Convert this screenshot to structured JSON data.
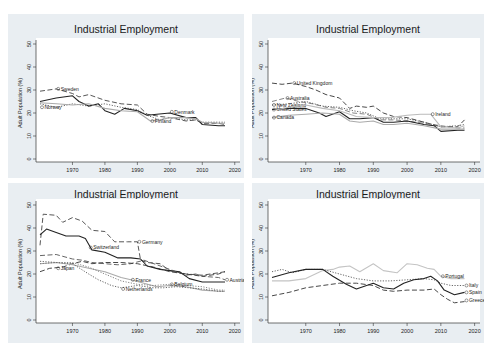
{
  "chart_data": [
    {
      "type": "line",
      "title": "Industrial Employment",
      "subtitle": "Nordic Countries",
      "xlabel": "",
      "ylabel": "Adult Population (%)",
      "xlim": [
        1960,
        2021
      ],
      "ylim": [
        0,
        50
      ],
      "xticks": [
        1970,
        1980,
        1990,
        2000,
        2010,
        2020
      ],
      "yticks": [
        0,
        10,
        20,
        30,
        40,
        50
      ],
      "series": [
        {
          "name": "Sweden",
          "style": "dash",
          "color": "#444444",
          "label_at": [
            1965,
            30.5
          ],
          "x": [
            1960,
            1965,
            1970,
            1972,
            1975,
            1980,
            1985,
            1990,
            1993,
            1997,
            2000,
            2005,
            2008,
            2010,
            2015,
            2017
          ],
          "y": [
            29.5,
            30.5,
            28.5,
            27,
            28,
            25.5,
            24,
            23.5,
            19.5,
            18.5,
            18,
            16.5,
            17,
            15.5,
            15.5,
            15
          ]
        },
        {
          "name": "Norway",
          "style": "dot",
          "color": "#555555",
          "label_at": [
            1960,
            22.5
          ],
          "x": [
            1960,
            1965,
            1970,
            1975,
            1980,
            1985,
            1990,
            1993,
            1997,
            2000,
            2005,
            2008,
            2010,
            2015,
            2017
          ],
          "y": [
            24,
            22.5,
            24,
            23,
            24,
            22.5,
            21.5,
            19,
            17,
            18,
            17,
            17,
            16,
            16,
            16
          ]
        },
        {
          "name": "Denmark",
          "style": "solid",
          "color": "#222222",
          "label_at": [
            2000,
            20.5
          ],
          "x": [
            1960,
            1965,
            1970,
            1972,
            1975,
            1978,
            1980,
            1983,
            1986,
            1990,
            1993,
            1996,
            2000,
            2005,
            2008,
            2010,
            2015,
            2017
          ],
          "y": [
            25,
            26.5,
            27.5,
            25,
            23,
            24,
            21,
            19.5,
            22,
            21,
            19,
            19.5,
            20,
            18,
            18,
            15,
            14.5,
            14.5
          ]
        },
        {
          "name": "Finland",
          "style": "solid",
          "color": "#aaaaaa",
          "label_at": [
            1994,
            16.5
          ],
          "x": [
            1960,
            1965,
            1970,
            1975,
            1980,
            1985,
            1990,
            1994,
            1997,
            2000,
            2005,
            2008,
            2010,
            2015,
            2017
          ],
          "y": [
            24.5,
            24,
            23.5,
            24,
            22,
            21,
            20.5,
            16.5,
            17,
            18,
            18,
            17.5,
            16,
            15.5,
            15.5
          ]
        }
      ]
    },
    {
      "type": "line",
      "title": "Industrial Employment",
      "subtitle": "Liberal Countries",
      "xlabel": "",
      "ylabel": "Adult Population (%)",
      "xlim": [
        1960,
        2021
      ],
      "ylim": [
        0,
        50
      ],
      "xticks": [
        1970,
        1980,
        1990,
        2000,
        2010,
        2020
      ],
      "yticks": [
        0,
        10,
        20,
        30,
        40,
        50
      ],
      "series": [
        {
          "name": "United Kingdom",
          "style": "dash",
          "color": "#333333",
          "label_at": [
            1966,
            33
          ],
          "x": [
            1960,
            1963,
            1966,
            1970,
            1973,
            1976,
            1980,
            1983,
            1985,
            1988,
            1990,
            1993,
            1996,
            2000,
            2005,
            2010,
            2015,
            2017
          ],
          "y": [
            33,
            32.5,
            33,
            31.5,
            30,
            28,
            26.5,
            22,
            23,
            22.5,
            23,
            20,
            18.5,
            18,
            16,
            14,
            14,
            17
          ]
        },
        {
          "name": "Australia",
          "style": "dash",
          "color": "#777777",
          "label_at": [
            1964,
            26.5
          ],
          "x": [
            1960,
            1964,
            1968,
            1972,
            1976,
            1980,
            1984,
            1988,
            1992,
            1996,
            2000,
            2005,
            2010,
            2015,
            2017
          ],
          "y": [
            25,
            26.5,
            25,
            24,
            22.5,
            22,
            20,
            19.5,
            17,
            17,
            16.5,
            15.5,
            14.5,
            13.5,
            13.5
          ]
        },
        {
          "name": "New Zealand",
          "style": "dot",
          "color": "#555555",
          "label_at": [
            1960,
            23.5
          ],
          "x": [
            1960,
            1965,
            1970,
            1975,
            1980,
            1984,
            1988,
            1992,
            1996,
            2000,
            2005,
            2010,
            2015,
            2017
          ],
          "y": [
            23.5,
            24,
            25,
            23,
            22.5,
            21,
            20,
            17.5,
            17.5,
            17.5,
            16,
            14,
            14.5,
            15
          ]
        },
        {
          "name": "United States",
          "style": "solid",
          "color": "#222222",
          "label_at": [
            1960,
            21.5
          ],
          "x": [
            1960,
            1965,
            1970,
            1974,
            1976,
            1980,
            1983,
            1986,
            1990,
            1993,
            1996,
            2000,
            2005,
            2008,
            2010,
            2015,
            2017
          ],
          "y": [
            21.5,
            22,
            22,
            20,
            18.5,
            20.5,
            17.5,
            17.5,
            18,
            16,
            16,
            16.5,
            15,
            14.5,
            12,
            12.5,
            12.5
          ]
        },
        {
          "name": "Canada",
          "style": "solid",
          "color": "#aaaaaa",
          "label_at": [
            1960,
            18
          ],
          "x": [
            1960,
            1965,
            1970,
            1975,
            1980,
            1983,
            1986,
            1990,
            1993,
            1996,
            2000,
            2005,
            2010,
            2015,
            2017
          ],
          "y": [
            18,
            19,
            19.5,
            20,
            19.5,
            16.5,
            16,
            16.5,
            15,
            15,
            15.5,
            14.5,
            13,
            13,
            13
          ]
        },
        {
          "name": "Ireland",
          "style": "solid",
          "color": "#bbbbbb",
          "label_at": [
            2007,
            19.5
          ],
          "x": [
            1960,
            1965,
            1970,
            1975,
            1980,
            1985,
            1990,
            1995,
            2000,
            2004,
            2007,
            2010,
            2015,
            2017
          ],
          "y": [
            21,
            22.5,
            23.5,
            22,
            21,
            18.5,
            18,
            18,
            19,
            19.5,
            19.5,
            14,
            13.5,
            14.5
          ]
        }
      ]
    },
    {
      "type": "line",
      "title": "Industrial Employment",
      "subtitle": "Continental Countries and Japan",
      "xlabel": "",
      "ylabel": "Adult Population (%)",
      "xlim": [
        1960,
        2021
      ],
      "ylim": [
        0,
        50
      ],
      "xticks": [
        1970,
        1980,
        1990,
        2000,
        2010,
        2020
      ],
      "yticks": [
        0,
        10,
        20,
        30,
        40,
        50
      ],
      "series": [
        {
          "name": "Germany",
          "style": "dash",
          "color": "#444444",
          "label_at": [
            1990,
            34
          ],
          "x": [
            1960,
            1961,
            1965,
            1967,
            1970,
            1973,
            1976,
            1980,
            1983,
            1987,
            1990,
            1991,
            1993,
            1997,
            2000,
            2005,
            2010,
            2015,
            2017
          ],
          "y": [
            32.5,
            46,
            45.5,
            42.5,
            44.5,
            43,
            39,
            38.5,
            34,
            34,
            34,
            26,
            25,
            24.5,
            21.5,
            20,
            19.5,
            20.5,
            21
          ]
        },
        {
          "name": "Switzerland",
          "style": "solid",
          "color": "#222222",
          "label_at": [
            1975,
            31.5
          ],
          "x": [
            1960,
            1962,
            1965,
            1968,
            1972,
            1974,
            1976,
            1980,
            1984,
            1988,
            1991,
            1993,
            1997,
            2000,
            2003,
            2006,
            2010,
            2015,
            2017
          ],
          "y": [
            37,
            39.5,
            38,
            36.5,
            36.5,
            35.5,
            30.5,
            29.5,
            27,
            27,
            26.5,
            23.5,
            22,
            21.5,
            21,
            18,
            16.5,
            16.5,
            16.5
          ]
        },
        {
          "name": "Austria",
          "style": "dash",
          "color": "#555555",
          "label_at": [
            2017,
            17.5
          ],
          "x": [
            1960,
            1965,
            1970,
            1973,
            1976,
            1980,
            1984,
            1988,
            1992,
            1996,
            2000,
            2005,
            2008,
            2010,
            2015,
            2017
          ],
          "y": [
            28,
            28.5,
            26.5,
            26,
            25,
            24.5,
            24,
            24.5,
            26,
            24,
            22,
            19.5,
            20,
            19,
            18.5,
            17.5
          ]
        },
        {
          "name": "Japan",
          "style": "dash",
          "color": "#333333",
          "label_at": [
            1965,
            22.5
          ],
          "x": [
            1960,
            1963,
            1967,
            1970,
            1973,
            1976,
            1980,
            1985,
            1990,
            1995,
            2000,
            2005,
            2010,
            2015,
            2017
          ],
          "y": [
            21,
            22.5,
            23,
            24.5,
            25.5,
            24.5,
            25,
            25,
            24.5,
            23,
            21,
            20,
            19,
            20,
            21
          ]
        },
        {
          "name": "France",
          "style": "solid",
          "color": "#aaaaaa",
          "label_at": [
            1988,
            17.5
          ],
          "x": [
            1960,
            1965,
            1970,
            1975,
            1980,
            1985,
            1988,
            1992,
            1996,
            2000,
            2005,
            2010,
            2015,
            2017
          ],
          "y": [
            24.5,
            25,
            24,
            22.5,
            21,
            18.5,
            17.5,
            16,
            14.5,
            15,
            14.5,
            13,
            12.5,
            12.5
          ]
        },
        {
          "name": "Netherlands",
          "style": "dot",
          "color": "#555555",
          "label_at": [
            1985,
            13.5
          ],
          "x": [
            1960,
            1965,
            1970,
            1975,
            1978,
            1982,
            1985,
            1990,
            1995,
            1998,
            2002,
            2006,
            2010,
            2015,
            2017
          ],
          "y": [
            25.5,
            25,
            24.5,
            20,
            17.5,
            15,
            14,
            15,
            14,
            14,
            14.5,
            14,
            13.5,
            12.5,
            12.5
          ]
        },
        {
          "name": "Belgium",
          "style": "dot",
          "color": "#777777",
          "label_at": [
            2000,
            15.5
          ],
          "x": [
            1960,
            1965,
            1970,
            1975,
            1980,
            1985,
            1990,
            1995,
            2000,
            2005,
            2010,
            2015,
            2017
          ],
          "y": [
            24.5,
            25,
            25,
            23,
            20,
            17,
            15.5,
            15,
            15.5,
            15,
            14.5,
            13,
            13
          ]
        }
      ]
    },
    {
      "type": "line",
      "title": "Industrial Employment",
      "subtitle": "Mediterranean Countries",
      "xlabel": "",
      "ylabel": "Adult Population (%)",
      "xlim": [
        1960,
        2021
      ],
      "ylim": [
        0,
        50
      ],
      "xticks": [
        1970,
        1980,
        1990,
        2000,
        2010,
        2020
      ],
      "yticks": [
        0,
        10,
        20,
        30,
        40,
        50
      ],
      "series": [
        {
          "name": "Portugal",
          "style": "solid",
          "color": "#c4c4c4",
          "label_at": [
            2010,
            19
          ],
          "x": [
            1960,
            1965,
            1970,
            1975,
            1978,
            1980,
            1983,
            1986,
            1990,
            1993,
            1997,
            2000,
            2003,
            2006,
            2008,
            2010,
            2013,
            2017
          ],
          "y": [
            17,
            17,
            18,
            21.5,
            22,
            23,
            23.5,
            21,
            24.5,
            21.5,
            20.5,
            24.5,
            24,
            22.5,
            22,
            19,
            18,
            18
          ]
        },
        {
          "name": "Italy",
          "style": "dot",
          "color": "#555555",
          "label_at": [
            2017,
            15
          ],
          "x": [
            1960,
            1963,
            1966,
            1970,
            1975,
            1980,
            1985,
            1990,
            1995,
            2000,
            2005,
            2008,
            2010,
            2013,
            2017
          ],
          "y": [
            21,
            22,
            20.5,
            22,
            22,
            20,
            18,
            17,
            17,
            17.5,
            18,
            17.5,
            16,
            15,
            15
          ]
        },
        {
          "name": "Spain",
          "style": "solid",
          "color": "#222222",
          "label_at": [
            2017,
            12
          ],
          "x": [
            1960,
            1965,
            1970,
            1975,
            1978,
            1982,
            1985,
            1988,
            1990,
            1993,
            1996,
            1999,
            2002,
            2005,
            2007,
            2009,
            2011,
            2014,
            2017
          ],
          "y": [
            18.5,
            20.5,
            22,
            22,
            19,
            15.5,
            13.5,
            15,
            16,
            14,
            13.5,
            16,
            17.5,
            18,
            19,
            17,
            13,
            11,
            12
          ]
        },
        {
          "name": "Greece",
          "style": "dash",
          "color": "#333333",
          "label_at": [
            2017,
            8.5
          ],
          "x": [
            1960,
            1965,
            1970,
            1975,
            1980,
            1985,
            1990,
            1993,
            1996,
            2000,
            2005,
            2008,
            2010,
            2012,
            2014,
            2017
          ],
          "y": [
            10.5,
            12,
            14,
            15,
            16,
            16,
            15,
            13,
            12.5,
            13,
            13,
            13.5,
            11,
            9,
            7.5,
            8
          ]
        }
      ]
    }
  ],
  "panels": [
    {
      "title": "Industrial Employment",
      "subtitle": "Nordic Countries"
    },
    {
      "title": "Industrial Employment",
      "subtitle": "Liberal Countries"
    },
    {
      "title": "Industrial Employment",
      "subtitle": "Continental Countries and Japan"
    },
    {
      "title": "Industrial Employment",
      "subtitle": "Mediterranean Countries"
    }
  ],
  "axis": {
    "ylabel": "Adult Population (%)"
  }
}
